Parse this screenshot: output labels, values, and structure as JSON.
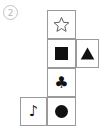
{
  "figure": {
    "index_label": "2",
    "colors": {
      "glyph": "#111111",
      "cell_border": "#9a9a9a",
      "badge": "#b8b8b8",
      "background": "#ffffff"
    }
  },
  "cells": [
    {
      "id": "r1c2",
      "row": 1,
      "col": 2,
      "symbol_name": "star-outline-icon",
      "symbol_char": "☆",
      "fill": "outline"
    },
    {
      "id": "r2c2",
      "row": 2,
      "col": 2,
      "symbol_name": "square-filled-icon",
      "symbol_char": "■",
      "fill": "solid"
    },
    {
      "id": "r2c3",
      "row": 2,
      "col": 3,
      "symbol_name": "triangle-filled-icon",
      "symbol_char": "▲",
      "fill": "solid"
    },
    {
      "id": "r3c2",
      "row": 3,
      "col": 2,
      "symbol_name": "club-suit-icon",
      "symbol_char": "♣",
      "fill": "solid"
    },
    {
      "id": "r4c1",
      "row": 4,
      "col": 1,
      "symbol_name": "music-note-icon",
      "symbol_char": "♪",
      "fill": "solid"
    },
    {
      "id": "r4c2",
      "row": 4,
      "col": 2,
      "symbol_name": "circle-filled-icon",
      "symbol_char": "●",
      "fill": "solid"
    }
  ]
}
